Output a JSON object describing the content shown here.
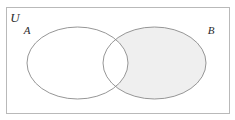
{
  "figure": {
    "kind": "venn-diagram",
    "caption": "",
    "background_color": "#ffffff",
    "universe": {
      "label": "U",
      "border_color": "#b9b9b9",
      "fill_color": "#ffffff",
      "x": 6,
      "y": 7,
      "width": 223,
      "height": 106,
      "label_x": 15,
      "label_y": 22
    },
    "sets": [
      {
        "id": "A",
        "label": "A",
        "cx": 77.5,
        "cy": 63,
        "rx": 50.5,
        "ry": 36,
        "fill_color": "#ffffff",
        "stroke_color": "#8a8a8a",
        "label_x": 27,
        "label_y": 34
      },
      {
        "id": "B",
        "label": "B",
        "cx": 154.5,
        "cy": 63,
        "rx": 51.5,
        "ry": 36,
        "fill_color": "#efefef",
        "stroke_color": "#8a8a8a",
        "label_x": 211,
        "label_y": 34
      }
    ],
    "shading": {
      "region": "B-minus-A",
      "description": "B \\ A shaded",
      "color": "#efefef",
      "intersection_color": "#ffffff"
    }
  }
}
